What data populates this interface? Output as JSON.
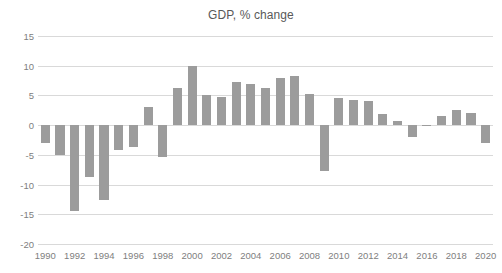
{
  "chart_data": {
    "type": "bar",
    "title": "GDP, % change",
    "xlabel": "",
    "ylabel": "",
    "ylim": [
      -20,
      15
    ],
    "ytick_values": [
      15,
      10,
      5,
      0,
      -5,
      -10,
      -15,
      -20
    ],
    "ytick_labels": [
      "15",
      "10",
      "5",
      "0",
      "-5",
      "-10",
      "-15",
      "-20"
    ],
    "xtick_labels": [
      "1990",
      "1992",
      "1994",
      "1996",
      "1998",
      "2000",
      "2002",
      "2004",
      "2006",
      "2008",
      "2010",
      "2012",
      "2014",
      "2016",
      "2018",
      "2020"
    ],
    "grid": true,
    "legend": "none",
    "bar_color": "#9c9c9c",
    "grid_color": "#d9d9d9",
    "text_color": "#808080",
    "categories": [
      "1990",
      "1991",
      "1992",
      "1993",
      "1994",
      "1995",
      "1996",
      "1997",
      "1998",
      "1999",
      "2000",
      "2001",
      "2002",
      "2003",
      "2004",
      "2005",
      "2006",
      "2007",
      "2008",
      "2009",
      "2010",
      "2011",
      "2012",
      "2013",
      "2014",
      "2015",
      "2016",
      "2017",
      "2018",
      "2019",
      "2020"
    ],
    "values": [
      -3.0,
      -5.0,
      -14.5,
      -8.7,
      -12.6,
      -4.1,
      -3.6,
      3.0,
      -5.3,
      6.3,
      10.0,
      5.0,
      4.7,
      7.2,
      7.0,
      6.2,
      8.0,
      8.3,
      5.2,
      -7.8,
      4.5,
      4.3,
      4.0,
      1.8,
      0.7,
      -2.0,
      -0.2,
      1.6,
      2.5,
      2.0,
      -3.0
    ]
  }
}
